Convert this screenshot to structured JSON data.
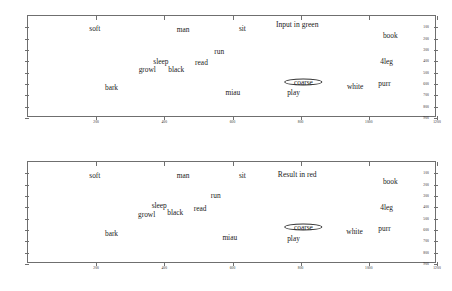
{
  "figure": {
    "title": "",
    "panel_count": 2
  },
  "chart_data": [
    {
      "type": "scatter",
      "title": "Input in green",
      "xlabel": "",
      "ylabel": "",
      "xlim": [
        0,
        1200
      ],
      "ylim": [
        0,
        900
      ],
      "y_inverted": true,
      "grid": false,
      "legend": "none",
      "xticks": [
        200,
        400,
        600,
        800,
        1000,
        1200
      ],
      "yticks": [
        100,
        200,
        300,
        400,
        500,
        600,
        700,
        800,
        900
      ],
      "annotations": [
        {
          "text": "Input in green",
          "x": 790,
          "y": 70
        }
      ],
      "highlight": {
        "label": "coarse",
        "x": 808,
        "y": 580,
        "shape": "ellipse",
        "rx": 52,
        "ry": 22
      },
      "points": [
        {
          "label": "soft",
          "x": 196,
          "y": 108
        },
        {
          "label": "man",
          "x": 455,
          "y": 112
        },
        {
          "label": "sit",
          "x": 629,
          "y": 108
        },
        {
          "label": "book",
          "x": 1063,
          "y": 165
        },
        {
          "label": "run",
          "x": 561,
          "y": 305
        },
        {
          "label": "4leg",
          "x": 1052,
          "y": 398
        },
        {
          "label": "sleep",
          "x": 390,
          "y": 395
        },
        {
          "label": "read",
          "x": 509,
          "y": 410
        },
        {
          "label": "growl",
          "x": 350,
          "y": 470
        },
        {
          "label": "black",
          "x": 435,
          "y": 472
        },
        {
          "label": "coarse",
          "x": 808,
          "y": 580
        },
        {
          "label": "purr",
          "x": 1046,
          "y": 590
        },
        {
          "label": "white",
          "x": 960,
          "y": 620
        },
        {
          "label": "bark",
          "x": 245,
          "y": 628
        },
        {
          "label": "miau",
          "x": 601,
          "y": 668
        },
        {
          "label": "play",
          "x": 779,
          "y": 672
        }
      ]
    },
    {
      "type": "scatter",
      "title": "Result in red",
      "xlabel": "",
      "ylabel": "",
      "xlim": [
        0,
        1200
      ],
      "ylim": [
        0,
        900
      ],
      "y_inverted": true,
      "grid": false,
      "legend": "none",
      "xticks": [
        200,
        400,
        600,
        800,
        1000,
        1200
      ],
      "yticks": [
        100,
        200,
        300,
        400,
        500,
        600,
        700,
        800,
        900
      ],
      "annotations": [
        {
          "text": "Result in red",
          "x": 790,
          "y": 110
        }
      ],
      "highlight": {
        "label": "coarse",
        "x": 808,
        "y": 570,
        "shape": "ellipse",
        "rx": 52,
        "ry": 22
      },
      "points": [
        {
          "label": "soft",
          "x": 196,
          "y": 115
        },
        {
          "label": "man",
          "x": 455,
          "y": 118
        },
        {
          "label": "sit",
          "x": 629,
          "y": 115
        },
        {
          "label": "book",
          "x": 1063,
          "y": 168
        },
        {
          "label": "run",
          "x": 551,
          "y": 290
        },
        {
          "label": "4leg",
          "x": 1052,
          "y": 395
        },
        {
          "label": "sleep",
          "x": 385,
          "y": 382
        },
        {
          "label": "read",
          "x": 505,
          "y": 410
        },
        {
          "label": "growl",
          "x": 348,
          "y": 462
        },
        {
          "label": "black",
          "x": 432,
          "y": 443
        },
        {
          "label": "coarse",
          "x": 808,
          "y": 570
        },
        {
          "label": "purr",
          "x": 1046,
          "y": 582
        },
        {
          "label": "white",
          "x": 958,
          "y": 612
        },
        {
          "label": "bark",
          "x": 245,
          "y": 625
        },
        {
          "label": "miau",
          "x": 592,
          "y": 665
        },
        {
          "label": "play",
          "x": 779,
          "y": 668
        }
      ]
    }
  ]
}
